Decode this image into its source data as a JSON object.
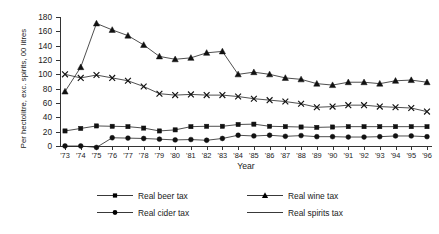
{
  "chart_data": {
    "type": "line",
    "title": "",
    "xlabel": "Year",
    "ylabel": "Per hectolitre, exc. spirits, 00 litres",
    "grid": false,
    "legend_position": "bottom",
    "ylim": [
      0,
      180
    ],
    "yticks": [
      0,
      20,
      40,
      60,
      80,
      100,
      120,
      140,
      160,
      180
    ],
    "categories": [
      "'73",
      "'74",
      "'75",
      "'76",
      "'77",
      "'78",
      "'79",
      "'80",
      "'81",
      "'82",
      "'83",
      "'84",
      "'85",
      "'86",
      "'87",
      "'88",
      "'89",
      "'90",
      "'91",
      "'92",
      "'93",
      "'94",
      "'95",
      "'96"
    ],
    "series": [
      {
        "name": "Real beer tax",
        "marker": "square",
        "values": [
          21,
          24.5,
          28,
          27.5,
          27,
          25,
          21,
          22.5,
          27,
          27.5,
          27.5,
          30,
          30.5,
          27.5,
          27,
          26.5,
          26,
          26.5,
          27,
          27,
          27,
          27,
          27,
          27
        ]
      },
      {
        "name": "Real wine tax",
        "marker": "triangle",
        "values": [
          76,
          110,
          171,
          162,
          154,
          141,
          125,
          121,
          123,
          130,
          132,
          100,
          103,
          100,
          95,
          93,
          87,
          85,
          89,
          89,
          87,
          91,
          92,
          89
        ]
      },
      {
        "name": "Real cider tax",
        "marker": "circle",
        "values": [
          0,
          0,
          -2,
          11.5,
          11,
          10.5,
          9.5,
          8.5,
          9,
          8,
          10.5,
          15,
          14,
          15,
          13.5,
          14.5,
          13,
          13,
          12.5,
          12.5,
          13,
          14,
          14,
          13
        ]
      },
      {
        "name": "Real spirits tax",
        "marker": "cross",
        "values": [
          100,
          95,
          99,
          95,
          91,
          83,
          73,
          71,
          72,
          71,
          71,
          69,
          66,
          64,
          62,
          59,
          54,
          55,
          57,
          57,
          55,
          54,
          53,
          48
        ]
      }
    ]
  },
  "legend": {
    "items": [
      {
        "label": "Real beer tax",
        "marker": "square"
      },
      {
        "label": "Real wine tax",
        "marker": "triangle"
      },
      {
        "label": "Real cider tax",
        "marker": "circle"
      },
      {
        "label": "Real spirits tax",
        "marker": "cross"
      }
    ]
  }
}
